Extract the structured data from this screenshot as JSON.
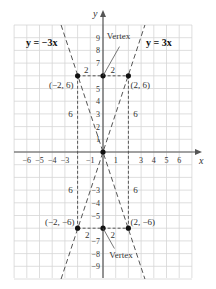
{
  "chart_data": {
    "type": "line",
    "title": "",
    "xlabel": "x",
    "ylabel": "y",
    "xlim": [
      -7,
      7
    ],
    "ylim": [
      -10,
      10
    ],
    "grid": true,
    "x_ticks": [
      "−6",
      "−5",
      "−4",
      "−3",
      "−1",
      "1",
      "3",
      "4",
      "5",
      "6"
    ],
    "y_ticks": [
      "9",
      "8",
      "7",
      "5",
      "4",
      "3",
      "2",
      "1",
      "−3",
      "−4",
      "−5",
      "−7",
      "−8",
      "−9"
    ],
    "series": [
      {
        "name": "y = −3x",
        "style": "dashed",
        "points": [
          [
            -3.3,
            10
          ],
          [
            3.3,
            -10
          ]
        ]
      },
      {
        "name": "y = 3x",
        "style": "dashed",
        "points": [
          [
            -3.3,
            -10
          ],
          [
            3.3,
            10
          ]
        ]
      }
    ],
    "points": [
      {
        "label": "(−2, 6)",
        "x": -2,
        "y": 6
      },
      {
        "label": "(2, 6)",
        "x": 2,
        "y": 6
      },
      {
        "label": "(−2, −6)",
        "x": -2,
        "y": -6
      },
      {
        "label": "(2, −6)",
        "x": 2,
        "y": -6
      },
      {
        "label": "",
        "x": 0,
        "y": 6
      },
      {
        "label": "",
        "x": 0,
        "y": -6
      },
      {
        "label": "",
        "x": 0,
        "y": 0
      }
    ],
    "annotations": [
      {
        "text": "Vertex",
        "at": [
          0,
          6
        ]
      },
      {
        "text": "Vertex",
        "at": [
          0,
          -6
        ]
      },
      {
        "text": "2",
        "segment": "horizontal top-left"
      },
      {
        "text": "2",
        "segment": "horizontal top-right"
      },
      {
        "text": "2",
        "segment": "horizontal bottom-left"
      },
      {
        "text": "2",
        "segment": "horizontal bottom-right"
      },
      {
        "text": "6",
        "segment": "vertical upper-left"
      },
      {
        "text": "6",
        "segment": "vertical upper-right"
      },
      {
        "text": "6",
        "segment": "vertical lower-left"
      },
      {
        "text": "6",
        "segment": "vertical lower-right"
      }
    ],
    "legend": [
      {
        "text": "y = −3x",
        "position": "top-left"
      },
      {
        "text": "y = 3x",
        "position": "top-right"
      }
    ]
  },
  "labels": {
    "x_axis": "x",
    "y_axis": "y",
    "eq_left": "y = −3x",
    "eq_right": "y = 3x",
    "vertex_top": "Vertex",
    "vertex_bottom": "Vertex",
    "pt_tl": "(−2, 6)",
    "pt_tr": "(2, 6)",
    "pt_bl": "(−2, −6)",
    "pt_br": "(2, −6)",
    "two": "2",
    "six": "6"
  }
}
